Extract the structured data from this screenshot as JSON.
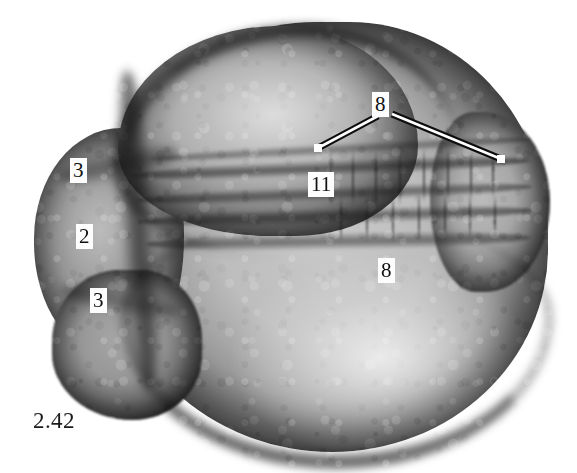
{
  "figure": {
    "caption_number": "2.42",
    "background_color": "#ffffff",
    "width": 577,
    "height": 473,
    "label_text_color": "#101010",
    "label_box_color": "#fdfdfd",
    "leader_line_fill": "#ffffff",
    "leader_line_stroke": "#0d0d0d"
  },
  "labels": [
    {
      "id": "label-3-upper",
      "text": "3",
      "x": 70,
      "y": 158,
      "name": "annotation-label-3-upper"
    },
    {
      "id": "label-2",
      "text": "2",
      "x": 76,
      "y": 224,
      "name": "annotation-label-2"
    },
    {
      "id": "label-3-lower",
      "text": "3",
      "x": 90,
      "y": 288,
      "name": "annotation-label-3-lower"
    },
    {
      "id": "label-8-top",
      "text": "8",
      "x": 372,
      "y": 92,
      "name": "annotation-label-8-top"
    },
    {
      "id": "label-11",
      "text": "11",
      "x": 308,
      "y": 172,
      "name": "annotation-label-11"
    },
    {
      "id": "label-8-lower",
      "text": "8",
      "x": 378,
      "y": 258,
      "name": "annotation-label-8-lower"
    }
  ],
  "leader_lines": [
    {
      "id": "leader-8-left",
      "from_x": 378,
      "from_y": 116,
      "to_x": 318,
      "to_y": 148,
      "name": "leader-line-8-left"
    },
    {
      "id": "leader-8-right",
      "from_x": 392,
      "from_y": 114,
      "to_x": 501,
      "to_y": 159,
      "name": "leader-line-8-right"
    }
  ],
  "specimen": {
    "regions": [
      {
        "name": "main-body-sphere",
        "left": 108,
        "top": 22,
        "width": 440,
        "height": 430
      },
      {
        "name": "upper-anterior-lobe",
        "left": 118,
        "top": 26,
        "width": 300,
        "height": 210
      },
      {
        "name": "left-protrusion",
        "left": 34,
        "top": 128,
        "width": 150,
        "height": 230
      },
      {
        "name": "left-lower-lobe",
        "left": 52,
        "top": 270,
        "width": 150,
        "height": 150
      },
      {
        "name": "right-bulge",
        "left": 430,
        "top": 112,
        "width": 120,
        "height": 180
      }
    ],
    "segment_bands": [
      {
        "name": "somite-band-0",
        "left": 150,
        "top": 143,
        "width": 380,
        "height": 12,
        "rotate": -3.0
      },
      {
        "name": "somite-band-1",
        "left": 130,
        "top": 160,
        "width": 400,
        "height": 16,
        "rotate": -2.2
      },
      {
        "name": "somite-band-2",
        "left": 136,
        "top": 186,
        "width": 396,
        "height": 15,
        "rotate": -2.0
      },
      {
        "name": "somite-band-3",
        "left": 140,
        "top": 208,
        "width": 392,
        "height": 16,
        "rotate": -1.6
      },
      {
        "name": "somite-band-4",
        "left": 146,
        "top": 232,
        "width": 384,
        "height": 18,
        "rotate": -1.0
      }
    ],
    "somite_ticks": [
      {
        "x": 330,
        "y": 152,
        "h": 54
      },
      {
        "x": 352,
        "y": 150,
        "h": 56
      },
      {
        "x": 375,
        "y": 149,
        "h": 58
      },
      {
        "x": 399,
        "y": 148,
        "h": 58
      },
      {
        "x": 423,
        "y": 147,
        "h": 56
      },
      {
        "x": 447,
        "y": 147,
        "h": 54
      },
      {
        "x": 470,
        "y": 148,
        "h": 52
      },
      {
        "x": 492,
        "y": 150,
        "h": 48
      },
      {
        "x": 340,
        "y": 196,
        "h": 46
      },
      {
        "x": 366,
        "y": 194,
        "h": 48
      },
      {
        "x": 392,
        "y": 193,
        "h": 50
      },
      {
        "x": 418,
        "y": 192,
        "h": 50
      },
      {
        "x": 444,
        "y": 192,
        "h": 48
      },
      {
        "x": 469,
        "y": 193,
        "h": 46
      },
      {
        "x": 494,
        "y": 195,
        "h": 42
      }
    ]
  }
}
